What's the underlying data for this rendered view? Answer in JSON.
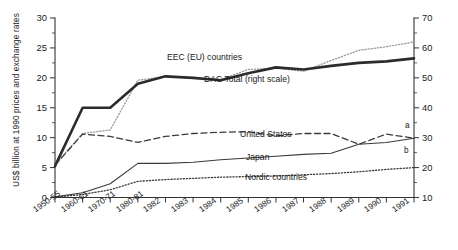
{
  "chart_data": {
    "type": "line",
    "title": "",
    "xlabel": "",
    "ylabel": "US$ billion at 1990 prices and exchange rates",
    "y2label": "",
    "ylim": [
      0,
      30
    ],
    "y2lim": [
      10,
      70
    ],
    "grid": false,
    "legend": "inline-annotations",
    "categories": [
      "1950-55",
      "1960-61",
      "1970-71",
      "1980-81",
      "1982",
      "1983",
      "1984",
      "1985",
      "1986",
      "1987",
      "1988",
      "1989",
      "1990",
      "1991"
    ],
    "x_tick_labels": [
      "1950-55",
      "1960-61",
      "1970-71",
      "1980-81",
      "1982",
      "1983",
      "1984",
      "1985",
      "1986",
      "1987",
      "1988",
      "1989",
      "1990",
      "1991"
    ],
    "y_tick_labels": [
      "0",
      "5",
      "10",
      "15",
      "20",
      "25",
      "30"
    ],
    "y_ticks": [
      0,
      5,
      10,
      15,
      20,
      25,
      30
    ],
    "y2_tick_labels": [
      "10",
      "20",
      "30",
      "40",
      "50",
      "60",
      "70"
    ],
    "y2_ticks": [
      10,
      20,
      30,
      40,
      50,
      60,
      70
    ],
    "series": [
      {
        "name": "EEC (EU) countries",
        "axis": "left",
        "style": "dotted",
        "color": "#9a9a9a",
        "label_text": "EEC (EU) countries",
        "values": [
          5.5,
          10.7,
          11.3,
          19.6,
          20.2,
          20.0,
          19.7,
          21.4,
          21.6,
          21.1,
          22.9,
          24.6,
          25.2,
          26.0
        ]
      },
      {
        "name": "DAC Total (right scale)",
        "axis": "right",
        "style": "solid-thick",
        "color": "#2b2b2b",
        "label_text": "DAC Total (right scale)",
        "values": [
          20.5,
          40.0,
          40.0,
          48.0,
          50.5,
          50.0,
          49.2,
          51.5,
          53.5,
          52.8,
          54.0,
          55.0,
          55.5,
          56.5
        ]
      },
      {
        "name": "United States",
        "axis": "left",
        "style": "dashed",
        "color": "#3a3a3a",
        "label_text": "United States",
        "values": [
          5.4,
          10.6,
          10.2,
          9.2,
          10.2,
          10.7,
          10.9,
          11.0,
          10.3,
          10.7,
          10.7,
          8.9,
          10.6,
          9.9
        ]
      },
      {
        "name": "Japan",
        "axis": "left",
        "style": "solid-thin",
        "color": "#3a3a3a",
        "label_text": "Japan",
        "values": [
          0.1,
          0.8,
          2.3,
          5.7,
          5.7,
          5.9,
          6.3,
          6.6,
          6.9,
          7.2,
          7.4,
          8.9,
          9.2,
          9.9
        ]
      },
      {
        "name": "Nordic countries",
        "axis": "left",
        "style": "fine-dotted",
        "color": "#3a3a3a",
        "label_text": "Nordic countries",
        "values": [
          0.05,
          0.5,
          1.3,
          2.7,
          3.0,
          3.2,
          3.4,
          3.5,
          3.6,
          3.8,
          4.0,
          4.3,
          4.7,
          5.0
        ]
      }
    ],
    "annotations": [
      {
        "name": "note-a",
        "text": "a",
        "x_category": "1991",
        "series": "United States"
      },
      {
        "name": "note-b",
        "text": "b",
        "x_category": "1991",
        "series": "Japan"
      }
    ]
  },
  "axes": {
    "left_title": "US$ billion at 1990 prices and exchange rates"
  }
}
